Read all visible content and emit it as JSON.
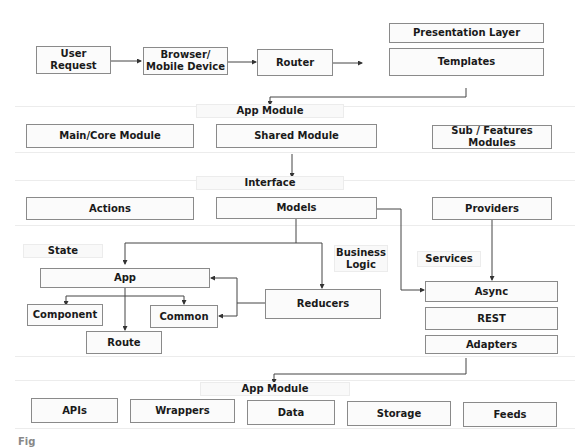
{
  "top_row": {
    "user_request": "User Request",
    "browser": "Browser/\nMobile Device",
    "router": "Router",
    "presentation_layer": "Presentation Layer",
    "templates": "Templates"
  },
  "app_module_section": {
    "label": "App Module",
    "main_core": "Main/Core Module",
    "shared": "Shared Module",
    "sub_features": "Sub / Features Modules"
  },
  "interface_section": {
    "label": "Interface",
    "actions": "Actions",
    "models": "Models",
    "providers": "Providers"
  },
  "state_section": {
    "state_label": "State",
    "business_logic_label": "Business\nLogic",
    "services_label": "Services",
    "app": "App",
    "component": "Component",
    "common": "Common",
    "route": "Route",
    "reducers": "Reducers",
    "async": "Async",
    "rest": "REST",
    "adapters": "Adapters"
  },
  "bottom_section": {
    "label": "App Module",
    "items": [
      "APIs",
      "Wrappers",
      "Data",
      "Storage",
      "Feeds"
    ]
  },
  "caption": "Fig"
}
